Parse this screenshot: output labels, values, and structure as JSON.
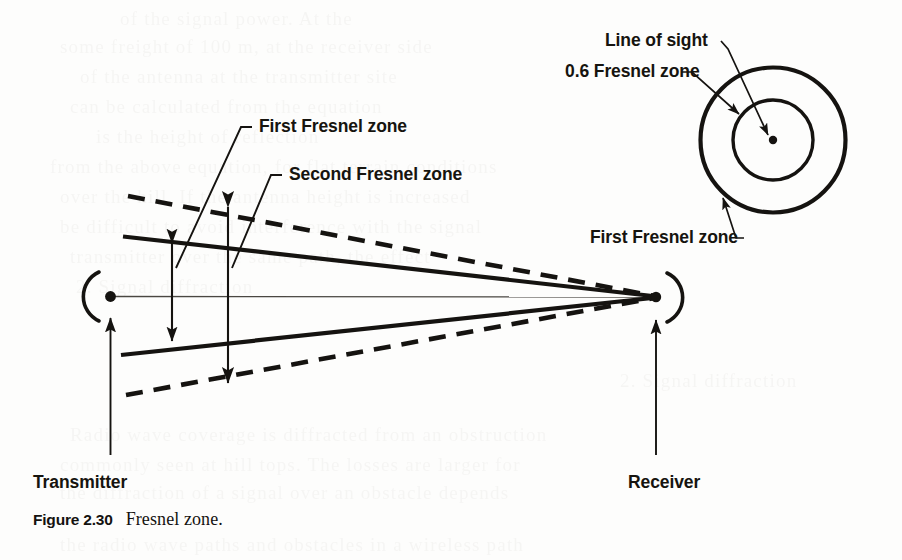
{
  "figure": {
    "caption_number": "Figure 2.30",
    "caption_text": "Fresnel zone.",
    "ink_color": "#151310",
    "paper_color": "#fdfdfc"
  },
  "labels": {
    "first_fresnel_zone_left": "First Fresnel zone",
    "second_fresnel_zone": "Second Fresnel zone",
    "line_of_sight": "Line of sight",
    "zone_06_fresnel": "0.6 Fresnel zone",
    "first_fresnel_zone_right": "First Fresnel zone",
    "transmitter": "Transmitter",
    "receiver": "Receiver"
  },
  "showthrough_lines": [
    {
      "text": "of the signal power. At the",
      "x": 120,
      "y": 4
    },
    {
      "text": "some freight of 100 m, at the receiver side",
      "x": 60,
      "y": 32
    },
    {
      "text": "of the antenna at the transmitter site",
      "x": 80,
      "y": 62
    },
    {
      "text": "can be calculated from the equation",
      "x": 70,
      "y": 92
    },
    {
      "text": "is the height of reflection",
      "x": 96,
      "y": 122
    },
    {
      "text": "from the above equation, for flat terrain conditions",
      "x": 50,
      "y": 152
    },
    {
      "text": "over the hill. If the antenna height is increased",
      "x": 60,
      "y": 182
    },
    {
      "text": "be difficult to avoid interference with the signal",
      "x": 60,
      "y": 212
    },
    {
      "text": "transmitter over the same path, the effect",
      "x": 70,
      "y": 242
    },
    {
      "text": "2. Signal diffraction",
      "x": 76,
      "y": 272
    },
    {
      "text": "2. Signal diffraction",
      "x": 620,
      "y": 366
    },
    {
      "text": "Radio wave coverage is diffracted from an obstruction",
      "x": 70,
      "y": 420
    },
    {
      "text": "commonly seen at hill tops. The losses are larger for",
      "x": 60,
      "y": 450
    },
    {
      "text": "the diffraction of a signal over an obstacle depends",
      "x": 60,
      "y": 478
    },
    {
      "text": "the radio wave paths and obstacles in a wireless path",
      "x": 60,
      "y": 530
    }
  ]
}
